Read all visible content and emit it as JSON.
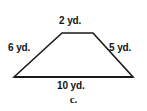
{
  "figure": {
    "shape_name": "trapezoid",
    "unit": "yd.",
    "stroke_color": "#1a1a1a",
    "background_color": "#ffffff",
    "labels": {
      "top": "2 yd.",
      "left": "6 yd.",
      "right": "5 yd.",
      "bottom": "10 yd."
    },
    "side_lengths": {
      "top": 2,
      "left": 6,
      "right": 5,
      "bottom": 10
    },
    "vertices": {
      "bottom_left": {
        "x": 14,
        "y": 77
      },
      "top_left": {
        "x": 62,
        "y": 33
      },
      "top_right": {
        "x": 93,
        "y": 33
      },
      "bottom_right": {
        "x": 133,
        "y": 77
      }
    }
  },
  "caption": {
    "text": "c."
  }
}
